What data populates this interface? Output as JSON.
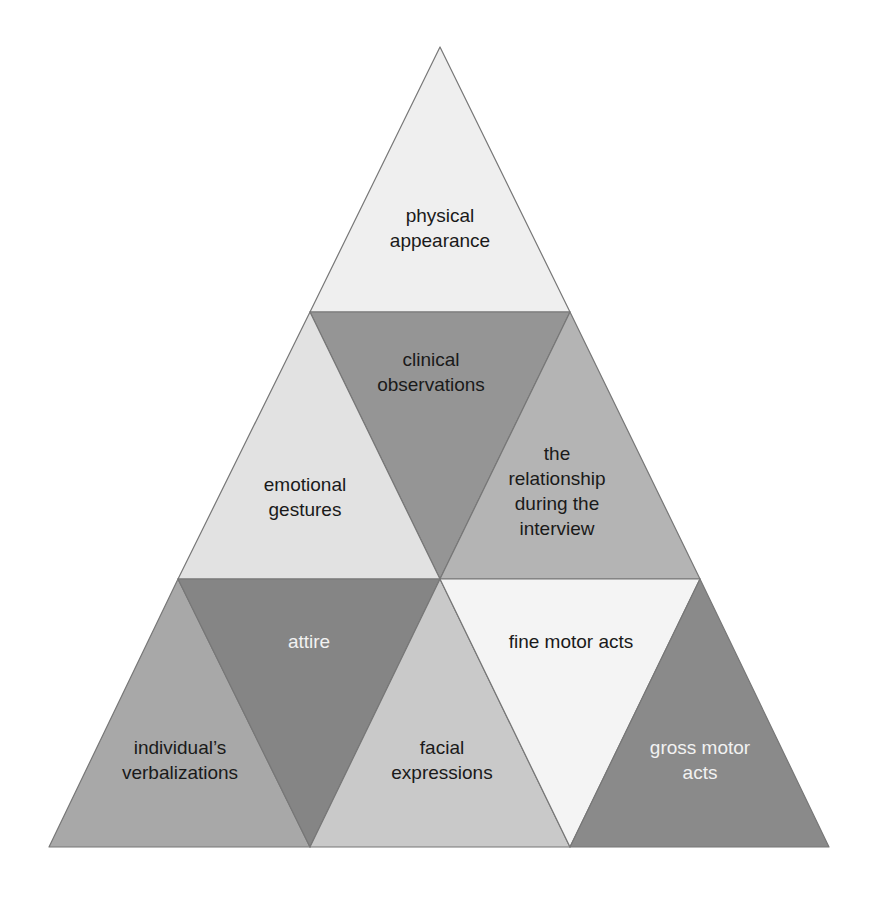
{
  "diagram": {
    "title": "",
    "type": "triangular-pyramid",
    "stroke_color": "#777777",
    "segments": [
      {
        "id": "physical-appearance",
        "lines": [
          "physical",
          "appearance"
        ],
        "fill": "#efefef",
        "text_color": "#1a1a1a",
        "points": "440,47 310,312 570,312",
        "cx": 440,
        "cy": 228
      },
      {
        "id": "clinical-observations",
        "lines": [
          "clinical",
          "observations"
        ],
        "fill": "#959595",
        "text_color": "#1a1a1a",
        "points": "310,312 570,312 440,579",
        "cx": 431,
        "cy": 372
      },
      {
        "id": "emotional-gestures",
        "lines": [
          "emotional",
          "gestures"
        ],
        "fill": "#e2e2e2",
        "text_color": "#1a1a1a",
        "points": "310,312 178,579 440,579",
        "cx": 305,
        "cy": 497
      },
      {
        "id": "relationship-during-interview",
        "lines": [
          "the",
          "relationship",
          "during the",
          "interview"
        ],
        "fill": "#b4b4b4",
        "text_color": "#1a1a1a",
        "points": "570,312 440,579 700,579",
        "cx": 557,
        "cy": 491
      },
      {
        "id": "individuals-verbalizations",
        "lines": [
          "individual’s",
          "verbalizations"
        ],
        "fill": "#a8a8a8",
        "text_color": "#1a1a1a",
        "points": "178,579 49,847 310,847",
        "cx": 180,
        "cy": 760
      },
      {
        "id": "attire",
        "lines": [
          "attire"
        ],
        "fill": "#858585",
        "text_color": "#f2f2f2",
        "points": "178,579 440,579 310,847",
        "cx": 309,
        "cy": 641
      },
      {
        "id": "facial-expressions",
        "lines": [
          "facial",
          "expressions"
        ],
        "fill": "#c9c9c9",
        "text_color": "#1a1a1a",
        "points": "440,579 310,847 570,847",
        "cx": 442,
        "cy": 760
      },
      {
        "id": "fine-motor-acts",
        "lines": [
          "fine motor acts"
        ],
        "fill": "#f4f4f4",
        "text_color": "#1a1a1a",
        "points": "440,579 700,579 570,847",
        "cx": 571,
        "cy": 641
      },
      {
        "id": "gross-motor-acts",
        "lines": [
          "gross motor",
          "acts"
        ],
        "fill": "#8a8a8a",
        "text_color": "#f2f2f2",
        "points": "700,579 570,847 829,847",
        "cx": 700,
        "cy": 760
      }
    ]
  }
}
